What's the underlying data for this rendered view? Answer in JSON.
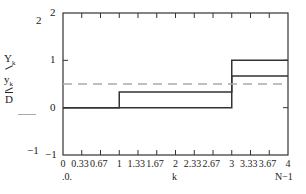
{
  "chart_data": {
    "type": "line",
    "title": "",
    "xlabel": "k",
    "xlabel_left": ".0.",
    "xlabel_right": "N−1",
    "ylabel_outer_top": "2",
    "ylabel_outer_bottom": "−1",
    "xlim": [
      0,
      4
    ],
    "ylim": [
      -1,
      2
    ],
    "x_ticks": [
      "0",
      "0.33",
      "0.67",
      "1",
      "1.33",
      "1.67",
      "2",
      "2.33",
      "2.67",
      "3",
      "3.33",
      "3.67",
      "4"
    ],
    "y_ticks": [
      "2",
      "1",
      "0",
      "−1"
    ],
    "grid": false,
    "legend": [
      "Y_k",
      "y_k",
      "D"
    ],
    "series": [
      {
        "name": "Y_k",
        "style": "solid",
        "color": "#333333",
        "step": true,
        "x": [
          0,
          1,
          1,
          3,
          3,
          4
        ],
        "y": [
          0,
          0,
          0,
          0,
          1,
          1
        ]
      },
      {
        "name": "y_k",
        "style": "solid",
        "color": "#333333",
        "step": true,
        "x": [
          0,
          1,
          1,
          3,
          3,
          4
        ],
        "y": [
          0,
          0,
          0.33,
          0.33,
          0.67,
          0.67
        ]
      },
      {
        "name": "D",
        "style": "dashed",
        "color": "#aaaaaa",
        "x": [
          0,
          4
        ],
        "y": [
          0.5,
          0.5
        ]
      }
    ]
  },
  "legend": {
    "y1_main": "Y",
    "y1_sub": "k",
    "y2_main": "y",
    "y2_sub": "k",
    "y3_main": "D"
  }
}
